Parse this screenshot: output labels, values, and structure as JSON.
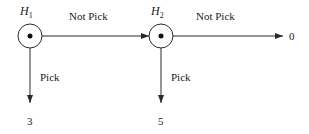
{
  "diagram": {
    "nodes": [
      {
        "id": "H1",
        "label": "H",
        "subscript": "1"
      },
      {
        "id": "H2",
        "label": "H",
        "subscript": "2"
      }
    ],
    "edges": [
      {
        "from": "H1",
        "to": "H2",
        "label": "Not Pick"
      },
      {
        "from": "H2",
        "to": "end",
        "label": "Not Pick"
      },
      {
        "from": "H1",
        "to": "payoff1",
        "label": "Pick"
      },
      {
        "from": "H2",
        "to": "payoff2",
        "label": "Pick"
      }
    ],
    "payoffs": {
      "h1_pick": "3",
      "h2_pick": "5",
      "h2_not_pick": "0"
    }
  },
  "colors": {
    "line": "#2a2a2a",
    "text": "#222222"
  }
}
